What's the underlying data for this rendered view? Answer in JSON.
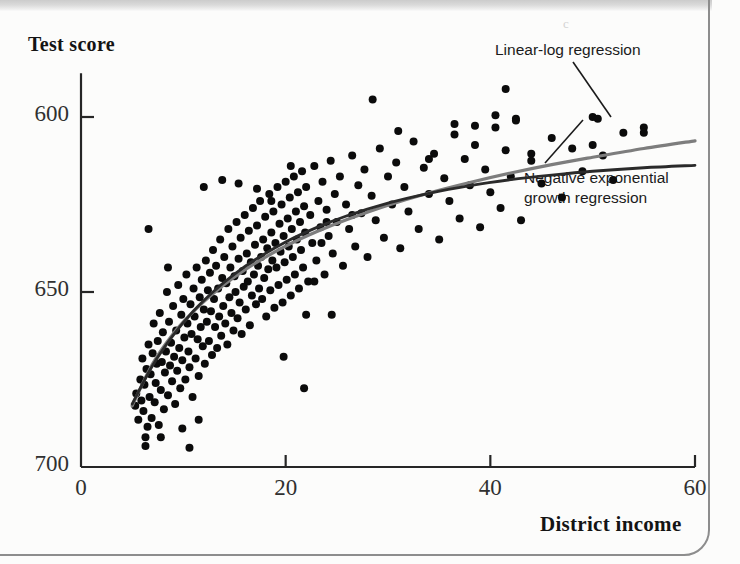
{
  "figure": {
    "background_color": "#fcfcfb",
    "stray_mark": "c"
  },
  "axes": {
    "y_title": "Test score",
    "x_title": "District income",
    "y_ticks": [
      "700",
      "650",
      "600"
    ],
    "x_ticks": [
      "0",
      "20",
      "40",
      "60"
    ]
  },
  "annotations": {
    "linear_log": "Linear-log regression",
    "neg_exp_line1": "Negative exponential",
    "neg_exp_line2": "growth regression"
  },
  "colors": {
    "scatter": "#0b0b0b",
    "linear_log_curve": "#7d7d7d",
    "neg_exp_curve": "#2a2a2a",
    "axis": "#262626",
    "text": "#141414"
  },
  "chart_data": {
    "type": "scatter",
    "title": "",
    "xlabel": "District income",
    "ylabel": "Test score",
    "xlim": [
      0,
      60
    ],
    "ylim": [
      600,
      712
    ],
    "xticks": [
      0,
      20,
      40,
      60
    ],
    "yticks": [
      600,
      650,
      700
    ],
    "grid": false,
    "legend_position": "in-plot-annotations",
    "series": [
      {
        "name": "Linear-log regression",
        "type": "line",
        "color": "#7d7d7d",
        "equation_form": "TestScore = b0 + b1*ln(Income)",
        "x": [
          5.0,
          7.0,
          9.0,
          11.0,
          13.0,
          15.0,
          17.0,
          20.0,
          23.0,
          26.0,
          30.0,
          34.0,
          38.0,
          42.0,
          46.0,
          50.0,
          55.0,
          60.0
        ],
        "y": [
          617.5,
          629.5,
          638.0,
          644.5,
          649.8,
          654.3,
          658.2,
          663.1,
          667.2,
          670.7,
          674.8,
          678.3,
          681.3,
          684.0,
          686.4,
          688.5,
          691.0,
          693.2
        ]
      },
      {
        "name": "Negative exponential growth regression",
        "type": "line",
        "color": "#2a2a2a",
        "equation_form": "TestScore = b0*(1 - exp(-b1*(Income-b2)))",
        "x": [
          5.0,
          7.0,
          9.0,
          11.0,
          13.0,
          15.0,
          17.0,
          20.0,
          23.0,
          26.0,
          30.0,
          34.0,
          38.0,
          42.0,
          46.0,
          50.0,
          55.0,
          60.0
        ],
        "y": [
          618.0,
          629.0,
          637.6,
          644.6,
          650.3,
          655.1,
          659.2,
          664.3,
          668.4,
          671.8,
          675.4,
          678.2,
          680.4,
          682.1,
          683.4,
          684.5,
          685.5,
          686.2
        ]
      },
      {
        "name": "Districts",
        "type": "scatter",
        "color": "#0b0b0b",
        "n_points": 420,
        "marker_size_px": 8,
        "points": [
          [
            5.3,
            617.5
          ],
          [
            5.4,
            621.0
          ],
          [
            5.6,
            613.5
          ],
          [
            5.8,
            625.0
          ],
          [
            5.9,
            619.0
          ],
          [
            6.0,
            631.0
          ],
          [
            6.1,
            616.0
          ],
          [
            6.2,
            623.5
          ],
          [
            6.3,
            608.5
          ],
          [
            6.4,
            628.0
          ],
          [
            6.5,
            611.5
          ],
          [
            6.6,
            635.0
          ],
          [
            6.7,
            620.0
          ],
          [
            6.8,
            626.5
          ],
          [
            6.9,
            614.0
          ],
          [
            7.0,
            632.5
          ],
          [
            7.1,
            641.0
          ],
          [
            7.2,
            618.5
          ],
          [
            7.3,
            624.0
          ],
          [
            7.4,
            629.5
          ],
          [
            7.5,
            636.0
          ],
          [
            7.6,
            612.0
          ],
          [
            7.7,
            644.0
          ],
          [
            7.8,
            622.0
          ],
          [
            7.9,
            630.0
          ],
          [
            8.0,
            638.5
          ],
          [
            8.1,
            616.5
          ],
          [
            8.2,
            627.0
          ],
          [
            8.3,
            633.0
          ],
          [
            8.4,
            650.0
          ],
          [
            8.5,
            620.5
          ],
          [
            8.6,
            641.5
          ],
          [
            8.7,
            629.0
          ],
          [
            8.8,
            635.5
          ],
          [
            8.9,
            624.5
          ],
          [
            9.0,
            646.0
          ],
          [
            9.1,
            631.5
          ],
          [
            9.2,
            618.0
          ],
          [
            9.3,
            639.0
          ],
          [
            9.4,
            627.5
          ],
          [
            9.5,
            652.0
          ],
          [
            9.6,
            634.0
          ],
          [
            9.7,
            622.5
          ],
          [
            9.8,
            643.5
          ],
          [
            9.9,
            630.5
          ],
          [
            10.0,
            648.0
          ],
          [
            10.1,
            637.0
          ],
          [
            10.2,
            625.0
          ],
          [
            10.3,
            655.0
          ],
          [
            10.4,
            641.0
          ],
          [
            10.5,
            633.0
          ],
          [
            10.6,
            628.5
          ],
          [
            10.7,
            646.5
          ],
          [
            10.8,
            638.0
          ],
          [
            10.9,
            620.0
          ],
          [
            11.0,
            651.0
          ],
          [
            11.1,
            643.0
          ],
          [
            11.2,
            631.0
          ],
          [
            11.3,
            657.0
          ],
          [
            11.4,
            636.5
          ],
          [
            11.5,
            626.0
          ],
          [
            11.6,
            648.5
          ],
          [
            11.7,
            640.0
          ],
          [
            11.8,
            653.5
          ],
          [
            11.9,
            634.5
          ],
          [
            12.0,
            645.0
          ],
          [
            12.1,
            629.5
          ],
          [
            12.2,
            659.0
          ],
          [
            12.3,
            641.5
          ],
          [
            12.4,
            650.5
          ],
          [
            12.5,
            636.0
          ],
          [
            12.6,
            655.5
          ],
          [
            12.7,
            644.5
          ],
          [
            12.8,
            632.0
          ],
          [
            12.9,
            662.0
          ],
          [
            13.0,
            648.0
          ],
          [
            13.1,
            640.0
          ],
          [
            13.2,
            657.5
          ],
          [
            13.3,
            634.0
          ],
          [
            13.4,
            651.0
          ],
          [
            13.5,
            643.0
          ],
          [
            13.6,
            665.0
          ],
          [
            13.7,
            637.5
          ],
          [
            13.8,
            654.0
          ],
          [
            13.9,
            646.0
          ],
          [
            14.0,
            660.0
          ],
          [
            14.1,
            641.0
          ],
          [
            14.2,
            652.5
          ],
          [
            14.3,
            635.0
          ],
          [
            14.4,
            668.0
          ],
          [
            14.5,
            648.5
          ],
          [
            14.6,
            657.0
          ],
          [
            14.7,
            644.0
          ],
          [
            14.8,
            663.0
          ],
          [
            14.9,
            639.0
          ],
          [
            15.0,
            654.5
          ],
          [
            15.1,
            650.0
          ],
          [
            15.2,
            670.0
          ],
          [
            15.3,
            642.5
          ],
          [
            15.4,
            659.5
          ],
          [
            15.5,
            647.0
          ],
          [
            15.6,
            665.5
          ],
          [
            15.7,
            638.0
          ],
          [
            15.8,
            656.0
          ],
          [
            15.9,
            651.5
          ],
          [
            16.0,
            672.0
          ],
          [
            16.1,
            645.0
          ],
          [
            16.2,
            661.0
          ],
          [
            16.3,
            653.0
          ],
          [
            16.4,
            667.5
          ],
          [
            16.5,
            640.5
          ],
          [
            16.6,
            658.5
          ],
          [
            16.7,
            649.0
          ],
          [
            16.8,
            674.0
          ],
          [
            16.9,
            655.0
          ],
          [
            17.0,
            663.5
          ],
          [
            17.1,
            646.5
          ],
          [
            17.2,
            669.0
          ],
          [
            17.3,
            657.5
          ],
          [
            17.4,
            651.0
          ],
          [
            17.5,
            676.0
          ],
          [
            17.6,
            660.0
          ],
          [
            17.7,
            648.0
          ],
          [
            17.8,
            665.0
          ],
          [
            17.9,
            654.0
          ],
          [
            18.0,
            671.5
          ],
          [
            18.1,
            643.0
          ],
          [
            18.2,
            662.5
          ],
          [
            18.3,
            656.5
          ],
          [
            18.4,
            678.0
          ],
          [
            18.5,
            650.5
          ],
          [
            18.6,
            667.0
          ],
          [
            18.7,
            659.0
          ],
          [
            18.8,
            673.0
          ],
          [
            18.9,
            645.5
          ],
          [
            19.0,
            664.0
          ],
          [
            19.1,
            657.0
          ],
          [
            19.2,
            680.0
          ],
          [
            19.3,
            652.0
          ],
          [
            19.4,
            669.5
          ],
          [
            19.5,
            661.5
          ],
          [
            19.6,
            675.0
          ],
          [
            19.7,
            647.0
          ],
          [
            19.8,
            666.0
          ],
          [
            19.9,
            658.5
          ],
          [
            20.0,
            681.5
          ],
          [
            20.1,
            653.5
          ],
          [
            20.2,
            671.0
          ],
          [
            20.3,
            663.0
          ],
          [
            20.4,
            677.0
          ],
          [
            20.5,
            649.0
          ],
          [
            20.6,
            668.0
          ],
          [
            20.7,
            660.0
          ],
          [
            20.8,
            683.0
          ],
          [
            20.9,
            655.0
          ],
          [
            21.0,
            673.0
          ],
          [
            21.1,
            665.0
          ],
          [
            21.2,
            678.5
          ],
          [
            21.3,
            651.0
          ],
          [
            21.4,
            670.0
          ],
          [
            21.5,
            662.0
          ],
          [
            21.6,
            684.5
          ],
          [
            21.7,
            657.0
          ],
          [
            21.8,
            674.5
          ],
          [
            21.9,
            667.0
          ],
          [
            22.0,
            680.0
          ],
          [
            22.2,
            653.0
          ],
          [
            22.4,
            672.0
          ],
          [
            22.6,
            664.0
          ],
          [
            22.8,
            686.0
          ],
          [
            23.0,
            659.0
          ],
          [
            23.2,
            676.0
          ],
          [
            23.4,
            668.5
          ],
          [
            23.6,
            681.5
          ],
          [
            23.8,
            655.0
          ],
          [
            24.0,
            673.5
          ],
          [
            24.2,
            666.0
          ],
          [
            24.4,
            687.5
          ],
          [
            24.6,
            661.0
          ],
          [
            24.8,
            678.0
          ],
          [
            25.0,
            670.0
          ],
          [
            25.3,
            683.0
          ],
          [
            25.6,
            657.5
          ],
          [
            25.9,
            675.0
          ],
          [
            26.2,
            668.0
          ],
          [
            26.5,
            689.0
          ],
          [
            26.8,
            663.0
          ],
          [
            27.1,
            680.5
          ],
          [
            27.4,
            672.5
          ],
          [
            27.7,
            685.0
          ],
          [
            28.0,
            660.0
          ],
          [
            28.4,
            677.5
          ],
          [
            28.8,
            670.5
          ],
          [
            29.2,
            691.0
          ],
          [
            29.6,
            665.5
          ],
          [
            30.0,
            683.0
          ],
          [
            30.4,
            675.0
          ],
          [
            30.8,
            687.0
          ],
          [
            31.2,
            662.5
          ],
          [
            31.6,
            680.0
          ],
          [
            32.0,
            673.0
          ],
          [
            32.5,
            693.0
          ],
          [
            33.0,
            668.0
          ],
          [
            33.5,
            685.5
          ],
          [
            34.0,
            678.0
          ],
          [
            34.5,
            689.5
          ],
          [
            35.0,
            665.0
          ],
          [
            35.5,
            682.5
          ],
          [
            36.0,
            676.0
          ],
          [
            36.5,
            695.0
          ],
          [
            37.0,
            671.0
          ],
          [
            37.5,
            688.0
          ],
          [
            38.0,
            680.5
          ],
          [
            38.5,
            692.0
          ],
          [
            39.0,
            668.5
          ],
          [
            39.5,
            685.0
          ],
          [
            40.0,
            678.5
          ],
          [
            40.5,
            697.0
          ],
          [
            41.0,
            674.0
          ],
          [
            41.5,
            690.5
          ],
          [
            42.0,
            683.0
          ],
          [
            42.5,
            699.5
          ],
          [
            43.0,
            670.5
          ],
          [
            44.0,
            687.5
          ],
          [
            45.0,
            681.0
          ],
          [
            46.0,
            694.0
          ],
          [
            47.0,
            677.0
          ],
          [
            48.0,
            691.0
          ],
          [
            49.0,
            684.5
          ],
          [
            50.0,
            700.0
          ],
          [
            51.0,
            689.0
          ],
          [
            52.0,
            682.0
          ],
          [
            53.0,
            695.5
          ],
          [
            55.0,
            697.0
          ],
          [
            28.5,
            705.0
          ],
          [
            41.5,
            708.0
          ],
          [
            22.0,
            643.5
          ],
          [
            24.5,
            643.5
          ],
          [
            19.8,
            631.5
          ],
          [
            21.8,
            622.5
          ],
          [
            9.9,
            611.0
          ],
          [
            11.5,
            613.5
          ],
          [
            7.8,
            608.5
          ],
          [
            6.3,
            606.0
          ],
          [
            10.6,
            605.5
          ],
          [
            8.5,
            657.0
          ],
          [
            6.6,
            668.0
          ],
          [
            23.5,
            664.0
          ],
          [
            22.8,
            653.0
          ],
          [
            12.0,
            680.0
          ],
          [
            13.8,
            682.0
          ],
          [
            15.4,
            681.0
          ],
          [
            17.2,
            679.5
          ],
          [
            18.6,
            676.0
          ],
          [
            20.5,
            686.0
          ],
          [
            24.0,
            670.0
          ],
          [
            26.5,
            672.0
          ],
          [
            31.0,
            696.0
          ],
          [
            34.0,
            688.0
          ],
          [
            36.5,
            698.0
          ],
          [
            38.5,
            697.5
          ],
          [
            40.5,
            700.5
          ],
          [
            42.5,
            699.0
          ],
          [
            44.0,
            689.5
          ],
          [
            50.0,
            692.0
          ],
          [
            50.5,
            699.5
          ],
          [
            55.0,
            695.5
          ]
        ]
      }
    ]
  }
}
